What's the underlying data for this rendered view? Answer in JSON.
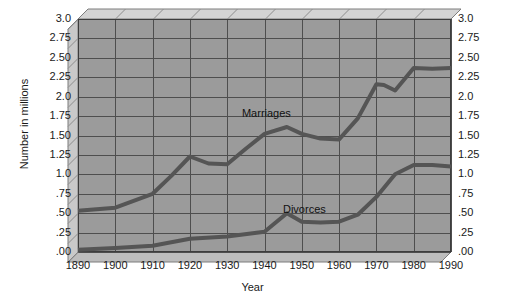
{
  "chart_data": {
    "type": "line",
    "title": "",
    "xlabel": "Year",
    "ylabel": "Number in millions",
    "xlim": [
      1890,
      1990
    ],
    "ylim": [
      0,
      3.0
    ],
    "grid": true,
    "legend_position": "inline-annotation",
    "x_ticks": [
      "1890",
      "1900",
      "1910",
      "1920",
      "1930",
      "1940",
      "1950",
      "1960",
      "1970",
      "1980",
      "1990"
    ],
    "y_ticks": [
      "3.0",
      "2.75",
      "2.50",
      "2.25",
      "2.0",
      "1.75",
      "1.50",
      "1.25",
      "1.0",
      ".75",
      ".50",
      ".25",
      ".00"
    ],
    "y_ticks_right": [
      "3.0",
      "2.75",
      "2.50",
      "2.25",
      "2.0",
      "1.75",
      "1.50",
      "1.25",
      "1.0",
      ".75",
      ".50",
      ".25",
      ".00"
    ],
    "series": [
      {
        "name": "Marriages",
        "color": "#555555",
        "x": [
          1890,
          1900,
          1910,
          1915,
          1920,
          1925,
          1930,
          1935,
          1940,
          1946,
          1950,
          1955,
          1960,
          1965,
          1970,
          1972,
          1975,
          1980,
          1985,
          1990
        ],
        "values": [
          0.53,
          0.57,
          0.75,
          0.98,
          1.23,
          1.14,
          1.13,
          1.33,
          1.52,
          1.61,
          1.52,
          1.46,
          1.45,
          1.72,
          2.16,
          2.15,
          2.08,
          2.37,
          2.36,
          2.37
        ]
      },
      {
        "name": "Divorces",
        "color": "#555555",
        "x": [
          1890,
          1900,
          1910,
          1920,
          1930,
          1940,
          1946,
          1950,
          1955,
          1960,
          1965,
          1970,
          1975,
          1980,
          1985,
          1990
        ],
        "values": [
          0.03,
          0.05,
          0.08,
          0.17,
          0.2,
          0.26,
          0.5,
          0.39,
          0.38,
          0.39,
          0.48,
          0.71,
          1.0,
          1.12,
          1.12,
          1.1
        ]
      }
    ],
    "annotations": [
      {
        "text": "Marriages",
        "x": 1942,
        "y": 1.79
      },
      {
        "text": "Divorces",
        "x": 1953,
        "y": 0.56
      }
    ],
    "colors": {
      "plot_background": "#9b9b9b",
      "gridline": "#4e4e4e",
      "line": "#555555",
      "wall_top": "#d4d4d4",
      "wall_side": "#c9c9c9",
      "page_background": "#ffffff",
      "text": "#1a1a1a"
    }
  }
}
